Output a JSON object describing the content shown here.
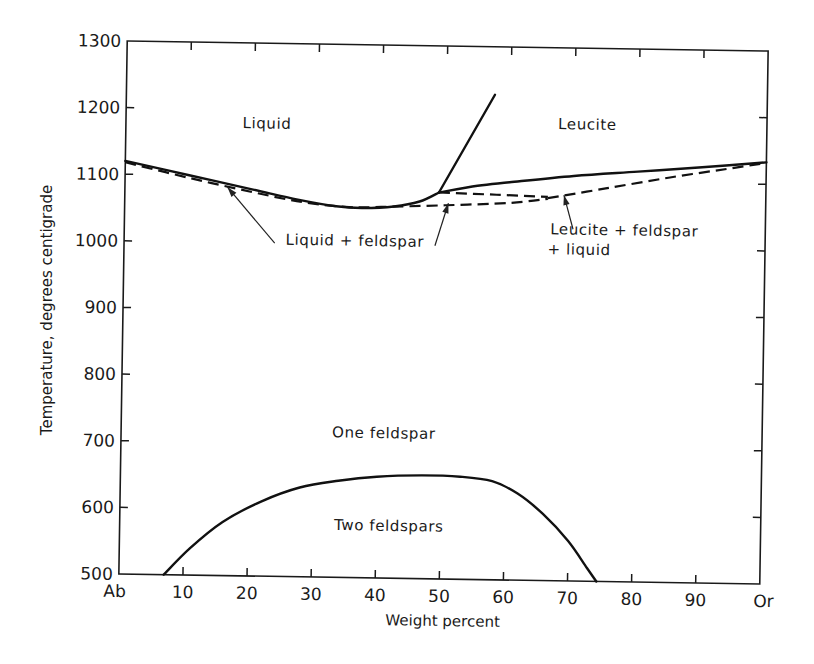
{
  "chart_data": {
    "type": "line",
    "title": "",
    "xlabel": "Weight percent",
    "ylabel": "Temperature, degrees centigrade",
    "xlim": [
      0,
      100
    ],
    "ylim": [
      500,
      1300
    ],
    "grid": false,
    "x_ticks": [
      0,
      10,
      20,
      30,
      40,
      50,
      60,
      70,
      80,
      90,
      100
    ],
    "x_tick_labels": [
      "Ab",
      "10",
      "20",
      "30",
      "40",
      "50",
      "60",
      "70",
      "80",
      "90",
      "Or"
    ],
    "y_ticks": [
      500,
      600,
      700,
      800,
      900,
      1000,
      1100,
      1200,
      1300
    ],
    "y_tick_labels": [
      "500",
      "600",
      "700",
      "800",
      "900",
      "1000",
      "1100",
      "1200",
      "1300"
    ],
    "series": [
      {
        "name": "Liquidus (feldspar field)",
        "style": "solid",
        "x": [
          0,
          10,
          20,
          27,
          33,
          37,
          42,
          46,
          49
        ],
        "y": [
          1120,
          1100,
          1080,
          1066,
          1057,
          1055,
          1058,
          1066,
          1080
        ]
      },
      {
        "name": "Liquidus (leucite field)",
        "style": "solid",
        "x": [
          49,
          55,
          60,
          70,
          80,
          90,
          100
        ],
        "y": [
          1080,
          1091,
          1097,
          1108,
          1116,
          1124,
          1133
        ]
      },
      {
        "name": "Leucite-liquid boundary",
        "style": "solid",
        "x": [
          49,
          57.5
        ],
        "y": [
          1080,
          1228
        ]
      },
      {
        "name": "Solidus (left)",
        "style": "dashed",
        "x": [
          0,
          10,
          20,
          28,
          35,
          40,
          50,
          60,
          66
        ],
        "y": [
          1118,
          1096,
          1076,
          1062,
          1056,
          1057,
          1061,
          1066,
          1073
        ]
      },
      {
        "name": "Leucite + feldspar + liquid upper boundary",
        "style": "dashed",
        "x": [
          49,
          58,
          66
        ],
        "y": [
          1080,
          1078,
          1076
        ]
      },
      {
        "name": "Solidus (right)",
        "style": "dashed",
        "x": [
          66,
          75,
          85,
          95,
          100
        ],
        "y": [
          1074,
          1090,
          1108,
          1124,
          1132
        ]
      },
      {
        "name": "Solvus",
        "style": "solid",
        "x": [
          7,
          11,
          16,
          22,
          28,
          34,
          40,
          47,
          53,
          58,
          62,
          66,
          70,
          73,
          74.5
        ],
        "y": [
          500,
          540,
          580,
          612,
          634,
          645,
          652,
          655,
          654,
          648,
          630,
          600,
          560,
          520,
          500
        ]
      }
    ],
    "annotations": [
      {
        "text": "Liquid",
        "x": 22,
        "y": 1172
      },
      {
        "text": "Leucite",
        "x": 72,
        "y": 1178
      },
      {
        "text": "Liquid + feldspar",
        "x": 36,
        "y": 998
      },
      {
        "text": "Leucite + feldspar",
        "x": 78,
        "y": 1020
      },
      {
        "text": "+ liquid",
        "x": 71,
        "y": 990
      },
      {
        "text": "One feldspar",
        "x": 41,
        "y": 710
      },
      {
        "text": "Two feldspars",
        "x": 42,
        "y": 571
      }
    ],
    "arrows": [
      {
        "from": [
          23.5,
          1000
        ],
        "to": [
          16,
          1083
        ]
      },
      {
        "from": [
          48.5,
          1000
        ],
        "to": [
          50.5,
          1064
        ]
      },
      {
        "from": [
          70,
          1028
        ],
        "to": [
          68.5,
          1079
        ]
      }
    ]
  }
}
